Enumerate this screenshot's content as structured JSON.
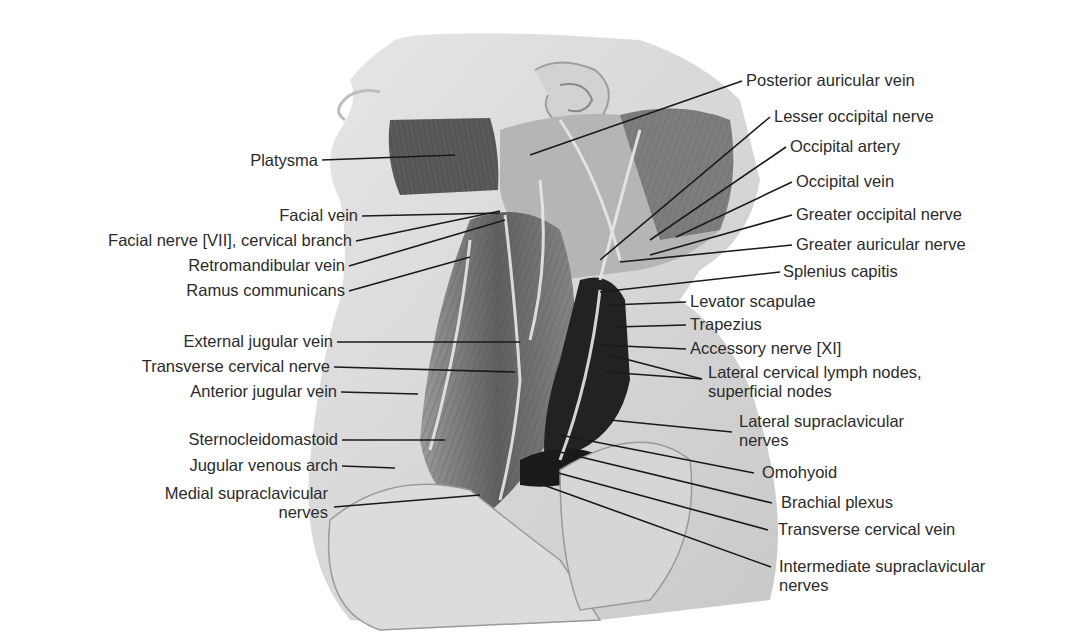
{
  "figure": {
    "colors": {
      "label_text": "#2b2b2b",
      "leader_line": "#1a1a1a",
      "skin": "#d9d9d9",
      "muscle": "#6e6e6e",
      "deep_space": "#1e1e1e"
    }
  },
  "labels_left": [
    {
      "text": "Platysma",
      "x": 318,
      "y": 160
    },
    {
      "text": "Facial vein",
      "x": 358,
      "y": 216
    },
    {
      "text": "Facial nerve [VII], cervical branch",
      "x": 352,
      "y": 241
    },
    {
      "text": "Retromandibular vein",
      "x": 345,
      "y": 266
    },
    {
      "text": "Ramus communicans",
      "x": 345,
      "y": 291
    },
    {
      "text": "External jugular vein",
      "x": 333,
      "y": 342
    },
    {
      "text": "Transverse cervical nerve",
      "x": 330,
      "y": 367
    },
    {
      "text": "Anterior jugular vein",
      "x": 337,
      "y": 392
    },
    {
      "text": "Sternocleidomastoid",
      "x": 338,
      "y": 440
    },
    {
      "text": "Jugular venous arch",
      "x": 338,
      "y": 466
    },
    {
      "text": "Medial supraclavicular",
      "line2": "nerves",
      "x": 328,
      "y": 494
    }
  ],
  "labels_right": [
    {
      "text": "Posterior auricular vein",
      "x": 746,
      "y": 81
    },
    {
      "text": "Lesser occipital nerve",
      "x": 774,
      "y": 117
    },
    {
      "text": "Occipital artery",
      "x": 790,
      "y": 147
    },
    {
      "text": "Occipital vein",
      "x": 796,
      "y": 182
    },
    {
      "text": "Greater occipital nerve",
      "x": 796,
      "y": 215
    },
    {
      "text": "Greater auricular nerve",
      "x": 796,
      "y": 245
    },
    {
      "text": "Splenius capitis",
      "x": 783,
      "y": 272
    },
    {
      "text": "Levator scapulae",
      "x": 690,
      "y": 302
    },
    {
      "text": "Trapezius",
      "x": 690,
      "y": 325
    },
    {
      "text": "Accessory nerve [XI]",
      "x": 690,
      "y": 349
    },
    {
      "text": "Lateral cervical lymph nodes,",
      "line2": "superficial nodes",
      "x": 708,
      "y": 373
    },
    {
      "text": "Lateral supraclavicular",
      "line2": "nerves",
      "x": 739,
      "y": 422
    },
    {
      "text": "Omohyoid",
      "x": 762,
      "y": 473
    },
    {
      "text": "Brachial plexus",
      "x": 781,
      "y": 503
    },
    {
      "text": "Transverse cervical vein",
      "x": 778,
      "y": 530
    },
    {
      "text": "Intermediate supraclavicular",
      "line2": "nerves",
      "x": 779,
      "y": 567
    }
  ]
}
